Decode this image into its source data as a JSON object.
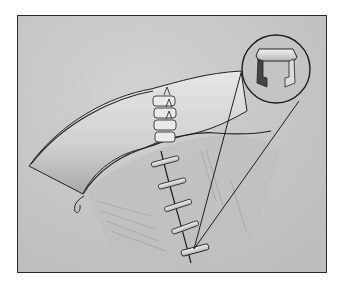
{
  "illustration": {
    "subject": "surgical-closure-with-skin-staples",
    "inset": "magnified-staple-detail",
    "staple_count_vertical": 6,
    "suture_count_fold": 4,
    "colors": {
      "background": "#c9c9c9",
      "frame": "#2a2a2a",
      "tissue_light": "#e4e4e4",
      "line": "#1e1e1e"
    }
  }
}
